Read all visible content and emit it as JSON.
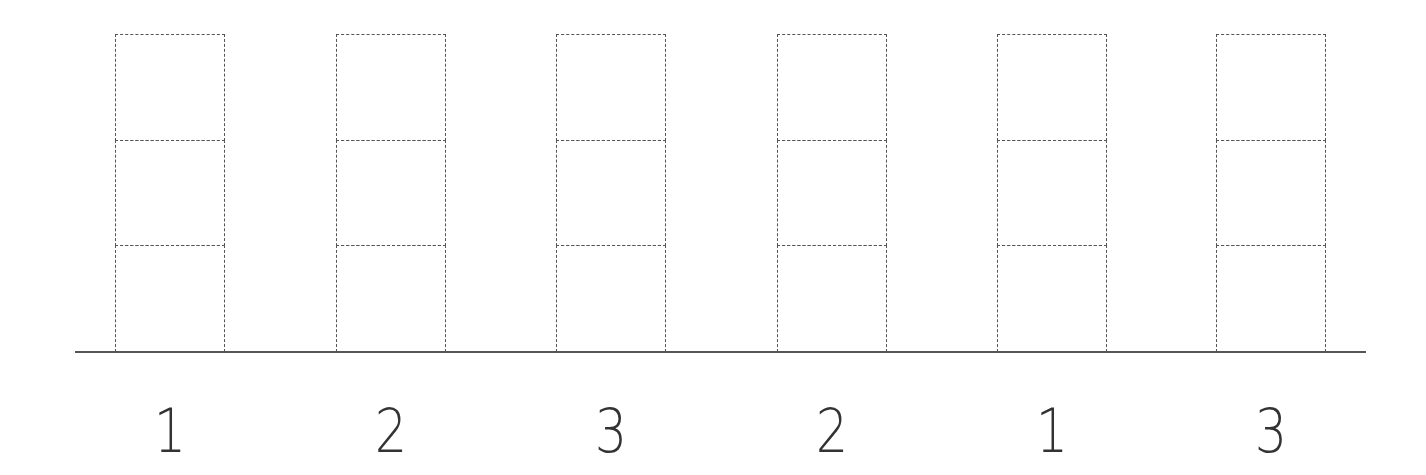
{
  "diagram": {
    "line_color": "#555555",
    "stacks": [
      {
        "label": "1",
        "blocks": 3
      },
      {
        "label": "2",
        "blocks": 3
      },
      {
        "label": "3",
        "blocks": 3
      },
      {
        "label": "2",
        "blocks": 3
      },
      {
        "label": "1",
        "blocks": 3
      },
      {
        "label": "3",
        "blocks": 3
      }
    ]
  }
}
